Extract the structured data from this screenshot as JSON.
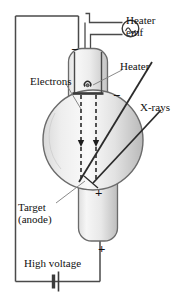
{
  "figure": {
    "kind": "x-ray-tube-schematic"
  },
  "labels": {
    "heater_emf_line1": "Heater",
    "heater_emf_line2": "emf",
    "heater": "Heater",
    "xrays": "X-rays",
    "electrons": "Electrons",
    "target_line1": "Target",
    "target_line2": "(anode)",
    "high_voltage": "High voltage"
  },
  "polarity": {
    "cathode_top_minus": "−",
    "cathode_side_minus": "−",
    "anode_plus": "+",
    "tube_bottom_plus": "+"
  },
  "symbols": {
    "ac_source": "ac-source-icon",
    "battery": "battery-icon"
  },
  "colors": {
    "stroke": "#3c3c3c",
    "stroke_dark": "#262626",
    "glass_fill_light": "#f2f2f2",
    "glass_fill_mid": "#d8d8d8",
    "glass_fill_dark": "#bcbcbc",
    "text": "#111111",
    "background": "#ffffff"
  }
}
